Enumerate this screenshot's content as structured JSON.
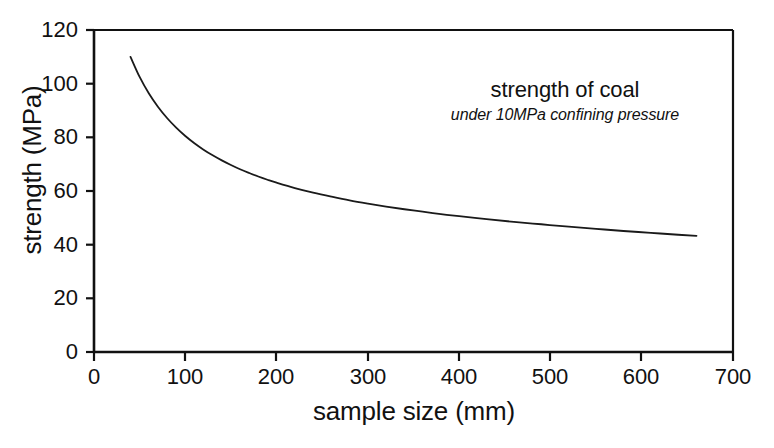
{
  "chart_data": {
    "type": "line",
    "title": "strength of coal",
    "subtitle": "under 10MPa confining pressure",
    "xlabel": "sample size (mm)",
    "ylabel": "strength (MPa)",
    "xlim": [
      0,
      700
    ],
    "ylim": [
      0,
      120
    ],
    "xticks": [
      0,
      100,
      200,
      300,
      400,
      500,
      600,
      700
    ],
    "yticks": [
      0,
      20,
      40,
      60,
      80,
      100,
      120
    ],
    "xtick_labels": [
      "0",
      "100",
      "200",
      "300",
      "400",
      "500",
      "600",
      "700"
    ],
    "ytick_labels": [
      "0",
      "20",
      "40",
      "60",
      "80",
      "100",
      "120"
    ],
    "grid": false,
    "legend": null,
    "series": [
      {
        "name": "strength of coal",
        "color": "#1a1a1a",
        "line_width": 1.8,
        "x": [
          40,
          50,
          60,
          70,
          80,
          90,
          100,
          110,
          120,
          130,
          140,
          150,
          160,
          170,
          180,
          190,
          200,
          220,
          240,
          260,
          280,
          300,
          320,
          340,
          360,
          380,
          400,
          430,
          460,
          490,
          520,
          550,
          580,
          610,
          640,
          660
        ],
        "y": [
          110.0,
          102.5,
          96.4,
          91.4,
          87.2,
          83.6,
          80.5,
          77.8,
          75.4,
          73.3,
          71.4,
          69.7,
          68.1,
          66.7,
          65.4,
          64.2,
          63.1,
          61.1,
          59.4,
          57.9,
          56.5,
          55.3,
          54.2,
          53.2,
          52.3,
          51.4,
          50.6,
          49.5,
          48.5,
          47.6,
          46.7,
          45.9,
          45.1,
          44.4,
          43.7,
          43.3
        ]
      }
    ],
    "annotations": [
      {
        "text": "strength of coal",
        "style": "regular"
      },
      {
        "text": "under 10MPa confining pressure",
        "style": "italic"
      }
    ]
  },
  "axes": {
    "ytick_labels": [
      "120",
      "100",
      "80",
      "60",
      "40",
      "20",
      "0"
    ],
    "xtick_labels": [
      "0",
      "100",
      "200",
      "300",
      "400",
      "500",
      "600",
      "700"
    ]
  },
  "colors": {
    "curve": "#1a1a1a",
    "frame": "#111111",
    "background": "#ffffff",
    "text": "#111111"
  }
}
